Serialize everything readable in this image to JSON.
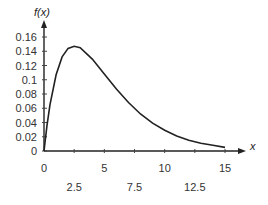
{
  "chart_data": {
    "type": "line",
    "title": "",
    "xlabel": "x",
    "ylabel": "f(x)",
    "xlim": [
      0,
      15
    ],
    "ylim": [
      0,
      0.16
    ],
    "grid": false,
    "legend": null,
    "y_ticks": [
      "0",
      "0.02",
      "0.04",
      "0.06",
      "0.08",
      "0.1",
      "0.12",
      "0.14",
      "0.16"
    ],
    "x_ticks_row1": [
      "0",
      "5",
      "10",
      "15"
    ],
    "x_ticks_row2": [
      "2.5",
      "7.5",
      "12.5"
    ],
    "series": [
      {
        "name": "f(x)",
        "x": [
          0,
          0.25,
          0.5,
          1,
          1.5,
          2,
          2.5,
          3,
          4,
          5,
          6,
          7,
          8,
          9,
          10,
          11,
          12,
          13,
          14,
          15
        ],
        "values": [
          0,
          0.036,
          0.065,
          0.107,
          0.132,
          0.144,
          0.147,
          0.145,
          0.129,
          0.108,
          0.087,
          0.068,
          0.052,
          0.039,
          0.029,
          0.021,
          0.015,
          0.011,
          0.008,
          0.005
        ]
      }
    ]
  }
}
